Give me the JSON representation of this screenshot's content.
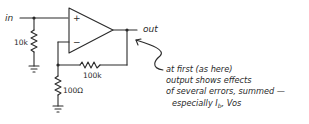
{
  "diagram": {
    "type": "op-amp non-inverting amplifier schematic",
    "labels": {
      "input": "in",
      "output": "out",
      "plus": "+",
      "minus": "−"
    },
    "components": {
      "r_input": "10k",
      "r_feedback": "100k",
      "r_ground": "100Ω"
    },
    "annotation": {
      "lines": [
        "at first  (as here)",
        "output shows effects",
        "of several errors, summed —",
        "especially "
      ],
      "terms": {
        "ib_main": "I",
        "ib_sub": "b",
        "sep": ", ",
        "vos": "Vos"
      }
    },
    "colors": {
      "ink": "#2a2a2a",
      "background": "#ffffff"
    }
  }
}
